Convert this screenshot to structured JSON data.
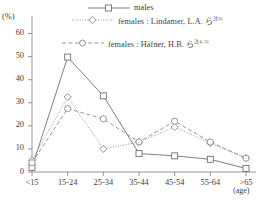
{
  "chart_data": {
    "type": "line",
    "title": "",
    "xlabel": "(age)",
    "ylabel": "(%)",
    "ylim": [
      0,
      65
    ],
    "yticks": [
      0,
      10,
      20,
      30,
      40,
      50,
      60
    ],
    "categories": [
      "<15",
      "15-24",
      "25-34",
      "35-44",
      "45-54",
      "55-64",
      ">65"
    ],
    "grid": false,
    "legend_position": "top-right",
    "series": [
      {
        "name": "males",
        "marker": "square",
        "linestyle": "solid",
        "color": "#707070",
        "x_offset": 0.0,
        "values": [
          2.0,
          49.8,
          33.0,
          8.0,
          7.0,
          5.5,
          1.5
        ]
      },
      {
        "name": "females : Lindamer, L.A. ら",
        "reference": "注3)",
        "marker": "diamond",
        "linestyle": "dotted",
        "color": "#8a8a8a",
        "x_offset": 0.0,
        "values": [
          5.0,
          32.5,
          10.0,
          13.0,
          19.5,
          12.5,
          6.0
        ]
      },
      {
        "name": "females : Häfner, H.B. ら",
        "reference": "注4, 5)",
        "marker": "circle",
        "linestyle": "dashed",
        "color": "#8a8a8a",
        "x_offset": 0.0,
        "values": [
          4.0,
          27.5,
          23.0,
          13.0,
          22.0,
          13.0,
          6.0
        ]
      }
    ]
  },
  "legend": {
    "items": [
      {
        "label": "males",
        "sup": ""
      },
      {
        "label": "females : Lindamer, L.A. ら",
        "sup": "注3)"
      },
      {
        "label": "females : Häfner, H.B. ら",
        "sup": "注4, 5)"
      }
    ]
  },
  "axes": {
    "y_unit": "(%)",
    "x_unit": "(age)",
    "y_tick_labels": [
      "0",
      "10",
      "20",
      "30",
      "40",
      "50",
      "60"
    ],
    "x_tick_labels": [
      "<15",
      "15-24",
      "25-34",
      "35-44",
      "45-54",
      "55-64",
      ">65"
    ]
  }
}
